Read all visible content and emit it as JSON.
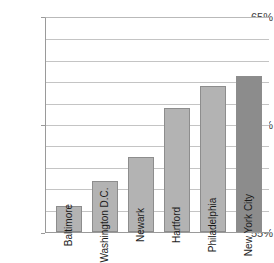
{
  "chart_data": {
    "type": "bar",
    "title": "",
    "subtitle": "",
    "xlabel": "",
    "ylabel": "",
    "categories": [
      "Baltimore",
      "Washington D.C.",
      "Newark",
      "Hartford",
      "Philadelphia",
      "New York City"
    ],
    "values": [
      56.2,
      57.4,
      58.5,
      60.8,
      61.8,
      62.3
    ],
    "ylim": [
      55,
      65
    ],
    "ytick_labels": [
      "65%",
      "60%",
      "55%"
    ],
    "ytick_values": [
      65,
      60,
      55
    ],
    "gridline_values": [
      65,
      64,
      63,
      62,
      61,
      60,
      59,
      58,
      57,
      56,
      55
    ],
    "grid": true,
    "legend": false,
    "legend_position": "none",
    "value_suffix": "%",
    "series": [
      {
        "name": "",
        "values": [
          56.2,
          57.4,
          58.5,
          60.8,
          61.8,
          62.3
        ]
      }
    ],
    "bar_colors": [
      "#b3b3b3",
      "#b3b3b3",
      "#b3b3b3",
      "#b3b3b3",
      "#b3b3b3",
      "#8c8c8c"
    ],
    "colors": {
      "bar_default": "#b3b3b3",
      "bar_highlight": "#8c8c8c",
      "bar_border": "#8d8d8d",
      "gridline": "#c4c4c4",
      "axis": "#9a9a9a",
      "tick_text": "#3d3d3d",
      "label_text": "#1c1c1c",
      "background": "#ffffff"
    }
  }
}
